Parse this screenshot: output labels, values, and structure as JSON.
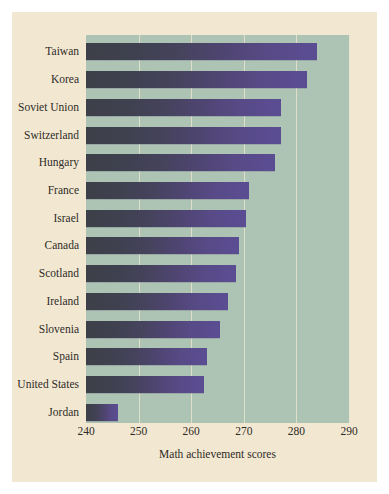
{
  "chart_data": {
    "type": "bar",
    "orientation": "horizontal",
    "title": "",
    "xlabel": "Math achievement scores",
    "ylabel": "",
    "xlim": [
      240,
      290
    ],
    "xticks": [
      240,
      250,
      260,
      270,
      280,
      290
    ],
    "grid": true,
    "legend": null,
    "categories": [
      "Taiwan",
      "Korea",
      "Soviet Union",
      "Switzerland",
      "Hungary",
      "France",
      "Israel",
      "Canada",
      "Scotland",
      "Ireland",
      "Slovenia",
      "Spain",
      "United States",
      "Jordan"
    ],
    "values": [
      284,
      282,
      277,
      277,
      276,
      271,
      270.5,
      269,
      268.5,
      267,
      265.5,
      263,
      262.5,
      246
    ],
    "colors": {
      "figure_background": "#f2e8d2",
      "plot_background": "#adc3b4",
      "gridline": "#e8e4cf",
      "bar_dark": "#3d4048",
      "bar_light": "#5b4d93",
      "text": "#2f2b26"
    }
  }
}
